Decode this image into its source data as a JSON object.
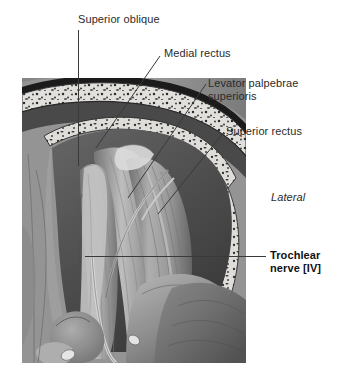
{
  "figure": {
    "style": "grayscale anatomical illustration",
    "orientation_note": "Lateral",
    "background_color": "#ffffff",
    "text_color": "#2b2b2b",
    "leader_color": "#3a3a3a"
  },
  "labels": [
    {
      "id": "superior-oblique",
      "text": "Superior oblique",
      "emphasis": "normal",
      "align": "left"
    },
    {
      "id": "medial-rectus",
      "text": "Medial rectus",
      "emphasis": "normal",
      "align": "left"
    },
    {
      "id": "levator-palpebrae",
      "text": "Levator palpebrae\nsuperioris",
      "emphasis": "normal",
      "align": "left"
    },
    {
      "id": "superior-rectus",
      "text": "Superior rectus",
      "emphasis": "normal",
      "align": "left"
    },
    {
      "id": "lateral",
      "text": "Lateral",
      "emphasis": "italic",
      "align": "left"
    },
    {
      "id": "trochlear-nerve",
      "text": "Trochlear\nnerve [IV]",
      "emphasis": "bold",
      "align": "left"
    }
  ],
  "leaders": [
    {
      "id": "leader-superior-oblique",
      "type": "vertical",
      "from": [
        78,
        30
      ],
      "to": [
        78,
        166
      ]
    },
    {
      "id": "leader-medial-rectus",
      "type": "diagonal",
      "from": [
        160,
        56
      ],
      "to": [
        96,
        148
      ]
    },
    {
      "id": "leader-levator-palpebrae",
      "type": "diagonal",
      "from": [
        204,
        84
      ],
      "to": [
        128,
        196
      ]
    },
    {
      "id": "leader-superior-rectus",
      "type": "diagonal",
      "from": [
        222,
        132
      ],
      "to": [
        158,
        212
      ]
    },
    {
      "id": "leader-trochlear-nerve",
      "type": "horizontal",
      "from": [
        85,
        256
      ],
      "to": [
        266,
        256
      ]
    }
  ],
  "illustration": {
    "frame": {
      "x": 22,
      "y": 74,
      "width": 224,
      "height": 289
    },
    "structures": [
      "frontal bone / orbital roof with cancellous bone speckle",
      "periorbita and dural sheath",
      "superior oblique muscle and tendon",
      "medial rectus muscle",
      "levator palpebrae superioris",
      "superior rectus muscle",
      "trochlear nerve [IV] coursing medially",
      "trochlea and cut tendon stump",
      "globe / eyeball, lateral aspect",
      "temporalis region soft tissue"
    ],
    "palette": {
      "bone_light": "#e7e4df",
      "bone_speckle": "#2f2f2f",
      "muscle_mid": "#9a9a9a",
      "muscle_light": "#c3c3c3",
      "muscle_dark": "#6d6d6d",
      "soft_tissue": "#8d8d8d",
      "shadow": "#4a4a4a",
      "highlight": "#dedede",
      "nerve": "#cfcfcf"
    }
  }
}
